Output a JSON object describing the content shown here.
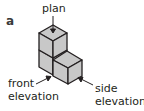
{
  "figure": {
    "label": "a",
    "labels": {
      "plan": "plan",
      "front_line1": "front",
      "front_line2": "elevation",
      "side_line1": "side",
      "side_line2": "elevation"
    },
    "colors": {
      "cube_face": "#c8c8c8",
      "outline": "#231f20",
      "text": "#231f20"
    }
  }
}
